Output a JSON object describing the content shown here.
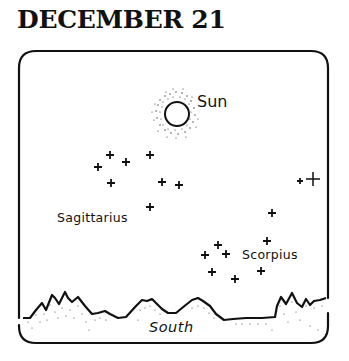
{
  "title": "DECEMBER 21",
  "labels": {
    "sun": "Sun",
    "sagittarius": "Sagittarius",
    "scorpius": "Scorpius",
    "direction": "South"
  },
  "colors": {
    "ink": "#111111",
    "background": "#ffffff"
  },
  "sun": {
    "cx": 177,
    "cy": 114,
    "r": 12
  },
  "constellations": {
    "sagittarius": {
      "stars": [
        {
          "x": 98,
          "y": 167
        },
        {
          "x": 110,
          "y": 155
        },
        {
          "x": 126,
          "y": 162
        },
        {
          "x": 150,
          "y": 155
        },
        {
          "x": 111,
          "y": 183
        },
        {
          "x": 162,
          "y": 182
        },
        {
          "x": 179,
          "y": 185
        },
        {
          "x": 150,
          "y": 207
        }
      ]
    },
    "scorpius": {
      "stars": [
        {
          "x": 205,
          "y": 255
        },
        {
          "x": 218,
          "y": 245
        },
        {
          "x": 226,
          "y": 254
        },
        {
          "x": 212,
          "y": 272
        },
        {
          "x": 235,
          "y": 279
        },
        {
          "x": 261,
          "y": 271
        },
        {
          "x": 267,
          "y": 241
        },
        {
          "x": 272,
          "y": 213
        },
        {
          "x": 300,
          "y": 181,
          "size": "small"
        },
        {
          "x": 313,
          "y": 179,
          "size": "large"
        }
      ]
    }
  }
}
